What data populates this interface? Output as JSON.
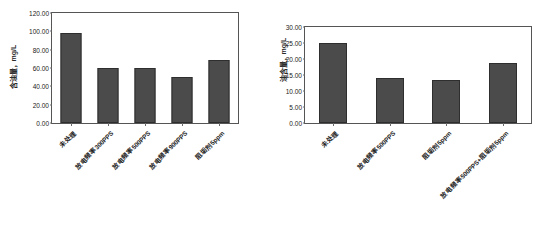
{
  "figure": {
    "background_color": "#ffffff",
    "bar_color": "#4b4b4b",
    "frame_color": "#555555",
    "top_noise": "",
    "bottom_caption": ""
  },
  "chart_data": [
    {
      "id": "oil-content-discharge-frequency",
      "type": "bar",
      "title": "",
      "xlabel": "",
      "ylabel": "含油量，mg/L",
      "ylim": [
        0,
        120
      ],
      "ytick_step": 20,
      "ytick_labels": [
        "0.00",
        "20.00",
        "40.00",
        "60.00",
        "80.00",
        "100.00",
        "120.00"
      ],
      "ytick_values": [
        0,
        20,
        40,
        60,
        80,
        100,
        120
      ],
      "grid": false,
      "legend": "none",
      "categories": [
        "未处理",
        "放电频率300PPS",
        "放电频率500PPS",
        "放电频率900PPS",
        "阻垢剂5ppm"
      ],
      "values": [
        98.0,
        60.5,
        60.0,
        50.5,
        69.0
      ]
    },
    {
      "id": "oil-content-scale-inhibitor",
      "type": "bar",
      "title": "",
      "xlabel": "",
      "ylabel": "油含量，mg/L",
      "ylim": [
        0,
        30
      ],
      "ytick_step": 5,
      "ytick_labels": [
        "0.00",
        "5.00",
        "10.00",
        "15.00",
        "20.00",
        "25.00",
        "30.00"
      ],
      "ytick_values": [
        0,
        5,
        10,
        15,
        20,
        25,
        30
      ],
      "grid": false,
      "legend": "none",
      "categories": [
        "未处理",
        "放电频率500PPS",
        "阻垢剂5ppm",
        "放电频率500PPS+阻垢剂5ppm"
      ],
      "values": [
        25.0,
        14.2,
        13.3,
        18.8
      ]
    }
  ]
}
